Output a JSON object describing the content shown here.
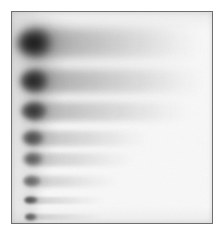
{
  "image": {
    "kind": "gel-electrophoresis-scan",
    "width": 221,
    "height": 234,
    "background_color": "#ffffff",
    "plate_color": "#f8f8f8",
    "frame": {
      "border_color": "#6f6f6f",
      "border_width": 1,
      "left": 11,
      "top": 11,
      "width": 202,
      "height": 213
    },
    "stain_color": "#111111"
  },
  "chart_data": {
    "type": "heatmap",
    "title": "",
    "xlabel": "",
    "ylabel": "",
    "categories": [
      "Band 1",
      "Band 2",
      "Band 3",
      "Band 4",
      "Band 5",
      "Band 6",
      "Band 7",
      "Band 8"
    ],
    "values": [
      1.0,
      0.88,
      0.76,
      0.62,
      0.5,
      0.42,
      0.34,
      0.26
    ],
    "grid": false,
    "legend": "none",
    "lanes": [
      {
        "label": "Band 1",
        "head_x": 33,
        "head_y": 42,
        "head_rx": 17,
        "head_ry": 15,
        "tail_x": 26,
        "tail_y": 42,
        "tail_length": 172,
        "tail_height": 30,
        "intensity": 1.0,
        "tail_intensity": 0.42
      },
      {
        "label": "Band 2",
        "head_x": 33,
        "head_y": 80,
        "head_rx": 14,
        "head_ry": 12,
        "tail_x": 26,
        "tail_y": 80,
        "tail_length": 176,
        "tail_height": 24,
        "intensity": 0.88,
        "tail_intensity": 0.4
      },
      {
        "label": "Band 3",
        "head_x": 33,
        "head_y": 110,
        "head_rx": 13,
        "head_ry": 10,
        "tail_x": 26,
        "tail_y": 110,
        "tail_length": 162,
        "tail_height": 19,
        "intensity": 0.76,
        "tail_intensity": 0.33
      },
      {
        "label": "Band 4",
        "head_x": 32,
        "head_y": 137,
        "head_rx": 11,
        "head_ry": 8,
        "tail_x": 25,
        "tail_y": 137,
        "tail_length": 122,
        "tail_height": 15,
        "intensity": 0.62,
        "tail_intensity": 0.28
      },
      {
        "label": "Band 5",
        "head_x": 32,
        "head_y": 158,
        "head_rx": 10,
        "head_ry": 7,
        "tail_x": 25,
        "tail_y": 158,
        "tail_length": 108,
        "tail_height": 13,
        "intensity": 0.54,
        "tail_intensity": 0.24
      },
      {
        "label": "Band 6",
        "head_x": 31,
        "head_y": 180,
        "head_rx": 9,
        "head_ry": 6,
        "tail_x": 24,
        "tail_y": 180,
        "tail_length": 92,
        "tail_height": 11,
        "intensity": 0.48,
        "tail_intensity": 0.22
      },
      {
        "label": "Band 7",
        "head_x": 30,
        "head_y": 199,
        "head_rx": 7,
        "head_ry": 4,
        "tail_x": 24,
        "tail_y": 199,
        "tail_length": 80,
        "tail_height": 7,
        "intensity": 0.62,
        "tail_intensity": 0.2
      },
      {
        "label": "Band 8",
        "head_x": 30,
        "head_y": 216,
        "head_rx": 6,
        "head_ry": 4,
        "tail_x": 24,
        "tail_y": 216,
        "tail_length": 78,
        "tail_height": 6,
        "intensity": 0.58,
        "tail_intensity": 0.18
      }
    ]
  }
}
